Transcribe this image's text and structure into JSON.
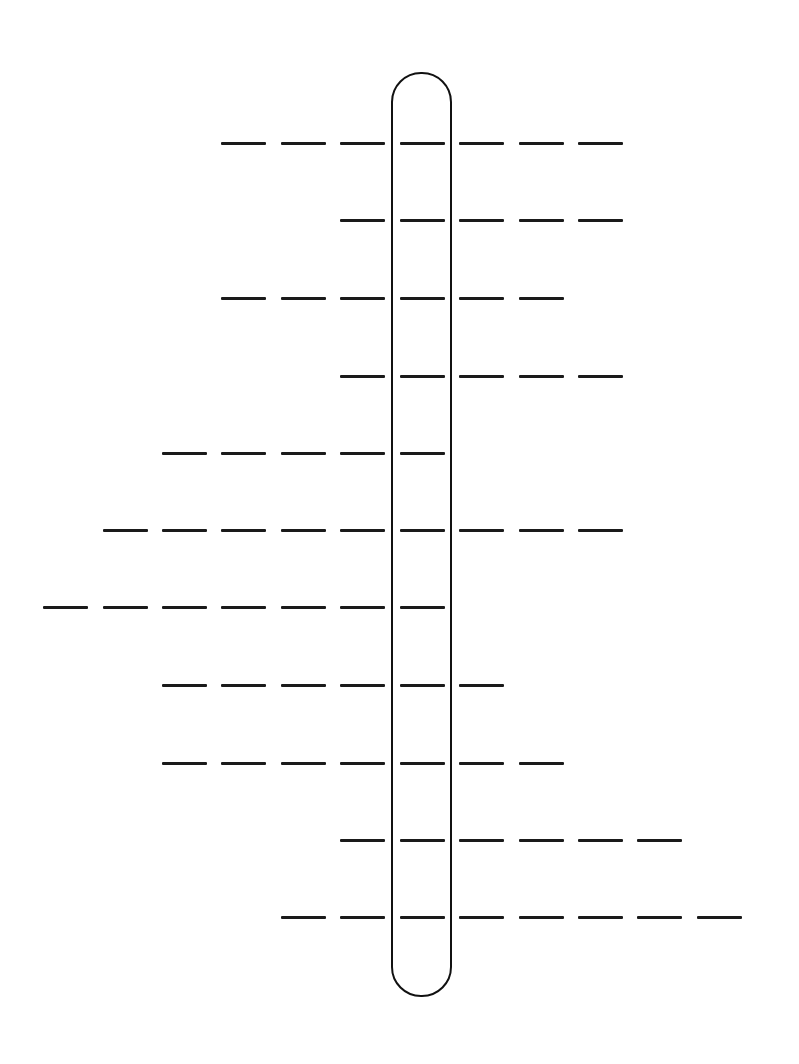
{
  "puzzle": {
    "type": "acrostic-crossword-blanks",
    "line_color": "#1a1a1a",
    "background": "#ffffff",
    "column_x_starts": [
      43,
      103,
      162,
      221,
      281,
      340,
      400,
      459,
      519,
      578,
      637,
      697
    ],
    "blank_width": 45,
    "highlight_column_index": 6,
    "highlight_capsule": {
      "left": 391,
      "top": 72,
      "width": 61,
      "height": 925
    },
    "rows": [
      {
        "y": 143,
        "start_col": 3,
        "length": 7
      },
      {
        "y": 220,
        "start_col": 5,
        "length": 5
      },
      {
        "y": 298,
        "start_col": 3,
        "length": 6
      },
      {
        "y": 376,
        "start_col": 5,
        "length": 5
      },
      {
        "y": 453,
        "start_col": 2,
        "length": 5
      },
      {
        "y": 530,
        "start_col": 1,
        "length": 9
      },
      {
        "y": 607,
        "start_col": 0,
        "length": 7
      },
      {
        "y": 685,
        "start_col": 2,
        "length": 6
      },
      {
        "y": 763,
        "start_col": 2,
        "length": 7
      },
      {
        "y": 840,
        "start_col": 5,
        "length": 6
      },
      {
        "y": 917,
        "start_col": 4,
        "length": 8
      }
    ]
  }
}
